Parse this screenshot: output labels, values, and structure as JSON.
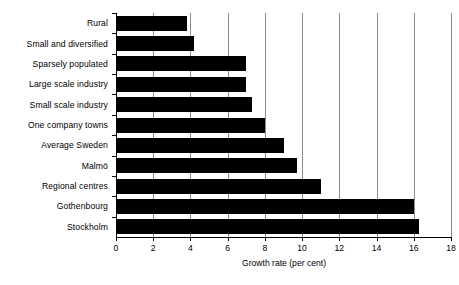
{
  "chart_data": {
    "type": "bar",
    "orientation": "horizontal",
    "title": "",
    "xlabel": "Growth rate (per cent)",
    "ylabel": "",
    "xlim": [
      0,
      18
    ],
    "xticks": [
      0,
      2,
      4,
      6,
      8,
      10,
      12,
      14,
      16,
      18
    ],
    "xtick_labels": [
      "0",
      "2",
      "4",
      "6",
      "8",
      "10",
      "12",
      "14",
      "16",
      "18"
    ],
    "grid": true,
    "grid_axis": "x",
    "legend": null,
    "bar_color": "#000000",
    "grid_color": "#8c8c8c",
    "axis_color": "#000000",
    "background_color": "#ffffff",
    "categories": [
      "Rural",
      "Small and diversified",
      "Sparsely populated",
      "Large scale industry",
      "Small scale industry",
      "One company towns",
      "Average Sweden",
      "Malmö",
      "Regional centres",
      "Gothenbourg",
      "Stockholm"
    ],
    "values": [
      3.8,
      4.2,
      7.0,
      7.0,
      7.3,
      8.0,
      9.0,
      9.7,
      11.0,
      16.0,
      16.3
    ]
  }
}
